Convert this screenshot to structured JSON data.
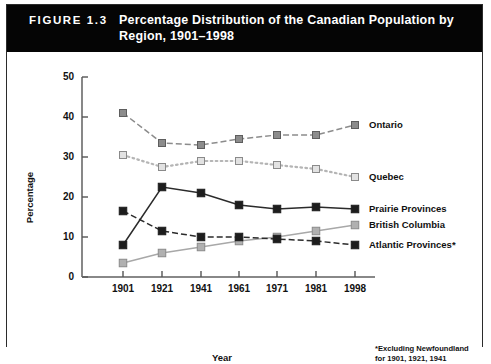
{
  "figure": {
    "number_label": "FIGURE 1.3",
    "title": "Percentage Distribution of the Canadian Population by Region, 1901–1998",
    "footnote_line1": "*Excluding Newfoundland",
    "footnote_line2": "for 1901, 1921, 1941"
  },
  "chart_data": {
    "type": "line",
    "title": "Percentage Distribution of the Canadian Population by Region, 1901–1998",
    "xlabel": "Year",
    "ylabel": "Percentage",
    "categories": [
      "1901",
      "1921",
      "1941",
      "1961",
      "1971",
      "1981",
      "1998"
    ],
    "x": [
      1901,
      1921,
      1941,
      1961,
      1971,
      1981,
      1998
    ],
    "xlim": [
      1901,
      1998
    ],
    "ylim": [
      0,
      50
    ],
    "yticks": [
      0,
      10,
      20,
      30,
      40,
      50
    ],
    "xticks": [
      "1901",
      "1921",
      "1941",
      "1961",
      "1971",
      "1981",
      "1998"
    ],
    "grid": false,
    "legend_position": "right-inline",
    "series": [
      {
        "name": "Ontario",
        "values": [
          41,
          33.5,
          33,
          34.5,
          35.5,
          35.5,
          38
        ],
        "color": "#8c8c8c",
        "line_style": "dashed",
        "marker": "filled-square-gray"
      },
      {
        "name": "Quebec",
        "values": [
          30.5,
          27.5,
          29,
          29,
          28,
          27,
          25
        ],
        "color": "#b5b5b5",
        "line_style": "dotted",
        "marker": "open-square-gray"
      },
      {
        "name": "Prairie Provinces",
        "values": [
          8,
          22.5,
          21,
          18,
          17,
          17.5,
          17
        ],
        "color": "#2b2b2b",
        "line_style": "solid",
        "marker": "filled-square-black"
      },
      {
        "name": "British Columbia",
        "values": [
          3.5,
          6,
          7.5,
          9,
          10,
          11.5,
          13
        ],
        "color": "#a8a8a8",
        "line_style": "solid",
        "marker": "filled-square-lightgray"
      },
      {
        "name": "Atlantic Provinces*",
        "values": [
          16.5,
          11.5,
          10,
          10,
          9.5,
          9,
          8
        ],
        "color": "#2b2b2b",
        "line_style": "dashed",
        "marker": "filled-square-black"
      }
    ],
    "annotations": [
      "*Excluding Newfoundland for 1901, 1921, 1941"
    ]
  }
}
